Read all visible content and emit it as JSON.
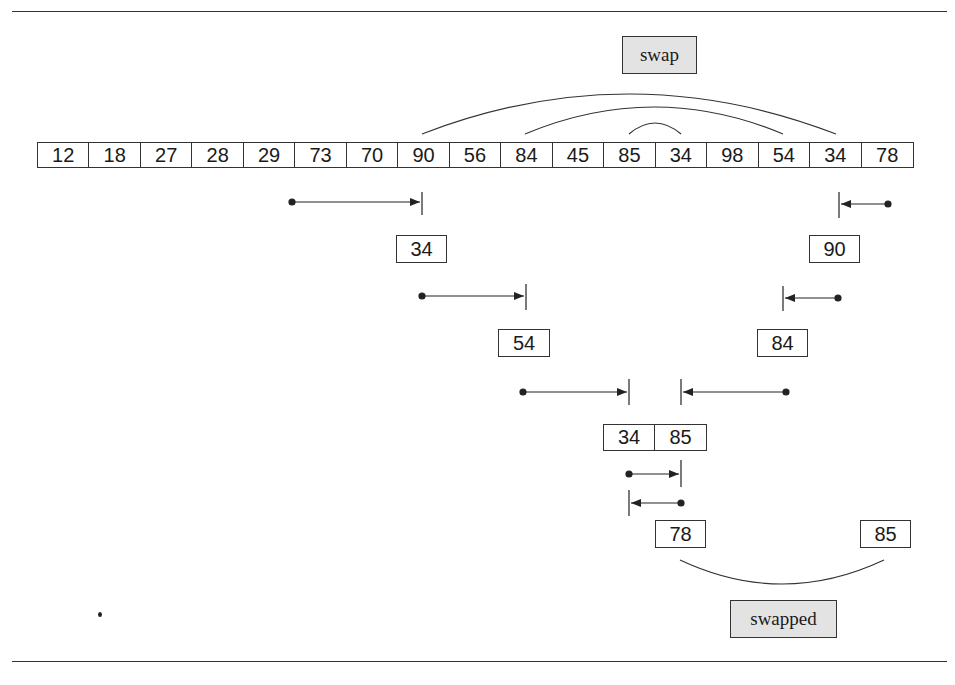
{
  "diagram": {
    "array": [
      "12",
      "18",
      "27",
      "28",
      "29",
      "73",
      "70",
      "90",
      "56",
      "84",
      "45",
      "85",
      "34",
      "98",
      "54",
      "34",
      "78"
    ],
    "labels": {
      "swap": "swap",
      "swapped": "swapped"
    },
    "scan_steps": [
      {
        "left_value": "34",
        "right_value": "90"
      },
      {
        "left_value": "54",
        "right_value": "84"
      },
      {
        "pair": [
          "34",
          "85"
        ]
      }
    ],
    "final_values": {
      "left": "78",
      "right": "85"
    },
    "arcs": [
      {
        "from_index": 7,
        "to_index": 15,
        "description": "90 <-> 34"
      },
      {
        "from_index": 9,
        "to_index": 14,
        "description": "84 <-> 54"
      },
      {
        "from_index": 11,
        "to_index": 12,
        "description": "85 <-> 34"
      }
    ]
  }
}
